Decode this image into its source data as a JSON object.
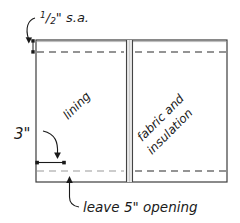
{
  "diagram": {
    "colors": {
      "outline": "#3d3d3d",
      "seam_dash_dark": "#2b2b2b",
      "seam_dash_light": "#9a9a9a",
      "center_band_fill": "#e8e8e8",
      "center_band_line": "#444444",
      "text": "#1a1a1a",
      "background": "#ffffff"
    },
    "panels": {
      "left": {
        "label": "lining",
        "rotation_deg": -45
      },
      "right": {
        "label_line1": "fabric and",
        "label_line2": "insulation",
        "rotation_deg": -45
      }
    },
    "annotations": {
      "seam_allowance": {
        "fraction_numerator": "1",
        "fraction_denominator": "2",
        "suffix": "\" s.a.",
        "full_text": "1/2\" s.a."
      },
      "side_measure": {
        "text": "3\""
      },
      "opening": {
        "text": "leave 5\" opening"
      }
    }
  }
}
